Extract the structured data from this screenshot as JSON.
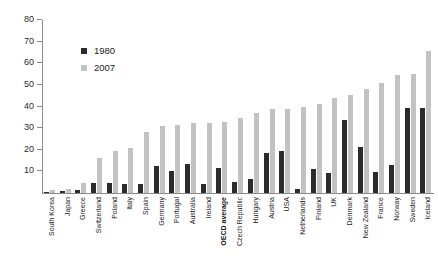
{
  "chart_data": {
    "type": "bar",
    "title": "",
    "xlabel": "",
    "ylabel": "",
    "ylim": [
      0,
      80
    ],
    "yticks": [
      10,
      20,
      30,
      40,
      50,
      60,
      70,
      80
    ],
    "grid": false,
    "legend_position": "top-left-inside",
    "categories": [
      "South Korea",
      "Japan",
      "Greece",
      "Switzerland",
      "Poland",
      "Italy",
      "Spain",
      "Germany",
      "Portugal",
      "Australia",
      "Ireland",
      "OECD average",
      "Czech Republic",
      "Hungary",
      "Austria",
      "USA",
      "Netherlands",
      "Finland",
      "UK",
      "Denmark",
      "New Zealand",
      "France",
      "Norway",
      "Sweden",
      "Iceland"
    ],
    "highlight_category": "OECD average",
    "series": [
      {
        "name": "1980",
        "color": "#2b2b2b",
        "values": [
          0.4,
          1.0,
          1.6,
          4.7,
          4.8,
          4.4,
          4.0,
          12.4,
          10.3,
          13.4,
          4.0,
          11.7,
          5.0,
          6.5,
          18.5,
          19.6,
          2.0,
          11.0,
          9.3,
          33.8,
          21.5,
          9.5,
          13.0,
          39.5,
          39.5
        ]
      },
      {
        "name": "2007",
        "color": "#c2c2c2",
        "values": [
          1.5,
          2.0,
          4.8,
          16.0,
          19.3,
          20.6,
          28.3,
          31.0,
          31.5,
          32.5,
          32.5,
          33.0,
          34.5,
          36.8,
          39.0,
          39.0,
          39.8,
          41.3,
          43.8,
          45.5,
          48.0,
          50.8,
          54.5,
          55.0,
          65.5
        ]
      }
    ]
  },
  "legend": {
    "entries": [
      {
        "label": "1980",
        "color": "#2b2b2b"
      },
      {
        "label": "2007",
        "color": "#c2c2c2"
      }
    ]
  }
}
